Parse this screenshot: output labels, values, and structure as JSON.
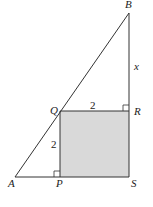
{
  "diagram": {
    "points": {
      "A": {
        "label": "A",
        "x": 15,
        "y": 177
      },
      "B": {
        "label": "B",
        "x": 129,
        "y": 13
      },
      "P": {
        "label": "P",
        "x": 60,
        "y": 177
      },
      "Q": {
        "label": "Q",
        "x": 60,
        "y": 111
      },
      "R": {
        "label": "R",
        "x": 129,
        "y": 111
      },
      "S": {
        "label": "S",
        "x": 129,
        "y": 177
      }
    },
    "measures": {
      "QR": "2",
      "PQ": "2",
      "BR": "x"
    },
    "colors": {
      "shade": "#d9d9d9",
      "stroke": "#333333"
    }
  }
}
